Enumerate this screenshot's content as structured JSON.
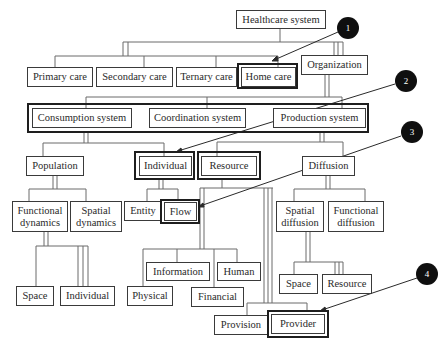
{
  "diagram": {
    "root": {
      "label": "Healthcare system"
    },
    "care_level": [
      {
        "label": "Primary care"
      },
      {
        "label": "Secondary care"
      },
      {
        "label": "Ternary care"
      },
      {
        "label": "Home care",
        "highlighted": true
      }
    ],
    "organization": {
      "label": "Organization"
    },
    "systems": [
      {
        "label": "Consumption system"
      },
      {
        "label": "Coordination system"
      },
      {
        "label": "Production system"
      }
    ],
    "level3": [
      {
        "label": "Population"
      },
      {
        "label": "Individual",
        "highlighted": true
      },
      {
        "label": "Resource",
        "highlighted": true
      },
      {
        "label": "Diffusion"
      }
    ],
    "population_children": [
      {
        "label": "Functional dynamics"
      },
      {
        "label": "Spatial dynamics"
      }
    ],
    "individual_children": [
      {
        "label": "Entity"
      },
      {
        "label": "Flow",
        "highlighted": true
      }
    ],
    "diffusion_children": [
      {
        "label": "Spatial diffusion"
      },
      {
        "label": "Functional diffusion"
      }
    ],
    "functional_dynamics_children": [
      {
        "label": "Space"
      },
      {
        "label": "Individual"
      }
    ],
    "resource_children": [
      {
        "label": "Information"
      },
      {
        "label": "Human"
      },
      {
        "label": "Physical"
      },
      {
        "label": "Financial"
      }
    ],
    "spatial_diffusion_children": [
      {
        "label": "Space"
      },
      {
        "label": "Resource"
      }
    ],
    "resource_bottom": [
      {
        "label": "Provision"
      },
      {
        "label": "Provider",
        "highlighted": true
      }
    ],
    "callouts": [
      {
        "number": "1",
        "target": "Home care"
      },
      {
        "number": "2",
        "target": "Individual"
      },
      {
        "number": "3",
        "target": "Flow"
      },
      {
        "number": "4",
        "target": "Provider"
      }
    ]
  }
}
